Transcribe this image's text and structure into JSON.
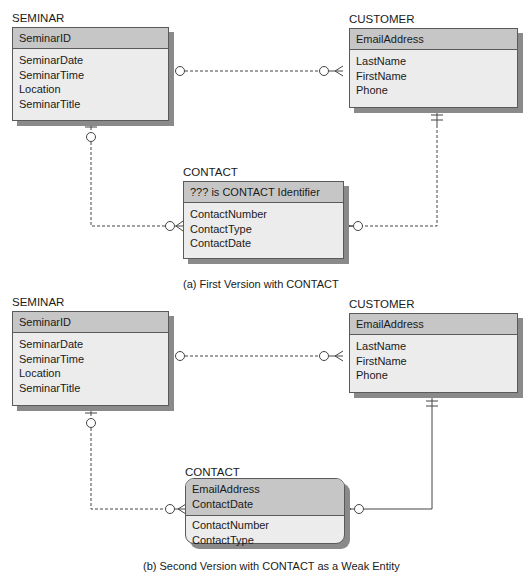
{
  "diagram_a": {
    "seminar": {
      "title": "SEMINAR",
      "key": "SeminarID",
      "attrs": [
        "SeminarDate",
        "SeminarTime",
        "Location",
        "SeminarTitle"
      ]
    },
    "customer": {
      "title": "CUSTOMER",
      "key": "EmailAddress",
      "attrs": [
        "LastName",
        "FirstName",
        "Phone"
      ]
    },
    "contact": {
      "title": "CONTACT",
      "key": "??? is CONTACT Identifier",
      "attrs": [
        "ContactNumber",
        "ContactType",
        "ContactDate"
      ]
    },
    "caption": "(a) First Version with CONTACT"
  },
  "diagram_b": {
    "seminar": {
      "title": "SEMINAR",
      "key": "SeminarID",
      "attrs": [
        "SeminarDate",
        "SeminarTime",
        "Location",
        "SeminarTitle"
      ]
    },
    "customer": {
      "title": "CUSTOMER",
      "key": "EmailAddress",
      "attrs": [
        "LastName",
        "FirstName",
        "Phone"
      ]
    },
    "contact": {
      "title": "CONTACT",
      "keys": [
        "EmailAddress",
        "ContactDate"
      ],
      "attrs": [
        "ContactNumber",
        "ContactType"
      ]
    },
    "caption": "(b) Second Version with CONTACT as a Weak Entity"
  },
  "colors": {
    "header": "#c6c6c6",
    "body": "#ececec",
    "shadow": "#8a8a8a",
    "border": "#5a5a5a"
  }
}
